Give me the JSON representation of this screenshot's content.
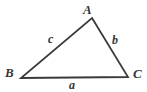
{
  "figure": {
    "kind": "triangle-diagram",
    "background_color": "#ffffff",
    "stroke_color": "#3a3a3a",
    "text_color": "#353535",
    "stroke_width": 1.8,
    "width": 147,
    "height": 92
  },
  "vertices": [
    {
      "id": "A",
      "label": "A",
      "x": 92,
      "y": 18
    },
    {
      "id": "B",
      "label": "B",
      "x": 21,
      "y": 78
    },
    {
      "id": "C",
      "label": "C",
      "x": 128,
      "y": 77
    }
  ],
  "sides": [
    {
      "id": "a",
      "label": "a",
      "from": "B",
      "to": "C",
      "position": "bottom"
    },
    {
      "id": "b",
      "label": "b",
      "from": "A",
      "to": "C",
      "position": "right"
    },
    {
      "id": "c",
      "label": "c",
      "from": "B",
      "to": "A",
      "position": "upper-left"
    }
  ]
}
